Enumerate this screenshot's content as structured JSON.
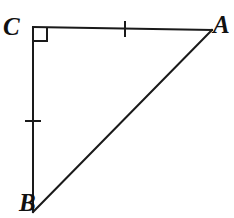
{
  "figure": {
    "kind": "right-triangle-diagram",
    "width": 234,
    "height": 218,
    "background_color": "#ffffff",
    "stroke_color": "#1a1a1a",
    "stroke_width": 2,
    "labels": {
      "vertex_a": "A",
      "vertex_b": "B",
      "vertex_c": "C"
    },
    "vertices": {
      "a": {
        "x": 212,
        "y": 30
      },
      "b": {
        "x": 33,
        "y": 212
      },
      "c": {
        "x": 33,
        "y": 27
      }
    },
    "segments": [
      {
        "name": "leg-CA",
        "from": "c",
        "to": "a",
        "tick_count": 1
      },
      {
        "name": "leg-CB",
        "from": "c",
        "to": "b",
        "tick_count": 1
      },
      {
        "name": "hypotenuse-BA",
        "from": "b",
        "to": "a",
        "tick_count": 0
      }
    ],
    "right_angle": {
      "at_vertex": "c",
      "marker": "square",
      "size": 14
    },
    "congruence_ticks": [
      {
        "on_segment": "leg-CA",
        "orientation": "vertical",
        "x": 125,
        "y": 29,
        "length": 16
      },
      {
        "on_segment": "leg-CB",
        "orientation": "horizontal",
        "x": 33,
        "y": 121,
        "length": 16
      }
    ]
  }
}
